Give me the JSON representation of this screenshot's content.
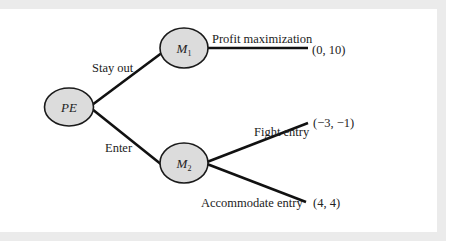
{
  "diagram": {
    "type": "game-tree",
    "colors": {
      "node_fill": "#dcdcdc",
      "node_stroke": "#1a1a1a",
      "edge": "#111111",
      "frame": "#ebebeb",
      "background": "#ffffff"
    },
    "nodes": [
      {
        "id": "PE",
        "label": "PE",
        "sub": ""
      },
      {
        "id": "M1",
        "label": "M",
        "sub": "1"
      },
      {
        "id": "M2",
        "label": "M",
        "sub": "2"
      }
    ],
    "edges": [
      {
        "from": "PE",
        "to": "M1",
        "label": "Stay out"
      },
      {
        "from": "PE",
        "to": "M2",
        "label": "Enter"
      },
      {
        "from": "M1",
        "to": "payoff1",
        "label": "Profit maximization"
      },
      {
        "from": "M2",
        "to": "payoff2",
        "label": "Fight entry"
      },
      {
        "from": "M2",
        "to": "payoff3",
        "label": "Accommodate entry"
      }
    ],
    "payoffs": [
      {
        "id": "payoff1",
        "value": "(0, 10)"
      },
      {
        "id": "payoff2",
        "value": "(−3, −1)"
      },
      {
        "id": "payoff3",
        "value": "(4, 4)"
      }
    ]
  }
}
